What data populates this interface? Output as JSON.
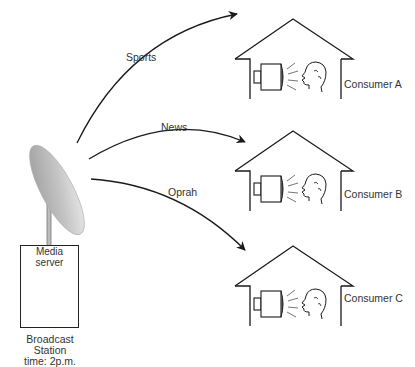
{
  "diagram": {
    "type": "broadcast-distribution",
    "source": {
      "title_line1": "Media",
      "title_line2": "server",
      "caption_line1": "Broadcast",
      "caption_line2": "Station",
      "caption_line3": "time: 2p.m."
    },
    "channels": [
      {
        "label": "Sports",
        "target": "Consumer A"
      },
      {
        "label": "News",
        "target": "Consumer B"
      },
      {
        "label": "Oprah",
        "target": "Consumer C"
      }
    ],
    "consumers": [
      {
        "label": "Consumer A"
      },
      {
        "label": "Consumer B"
      },
      {
        "label": "Consumer C"
      }
    ]
  },
  "colors": {
    "line": "#1a1a1a",
    "dish_light": "#e8e8e8",
    "dish_dark": "#8a8a8a",
    "text": "#333333"
  }
}
